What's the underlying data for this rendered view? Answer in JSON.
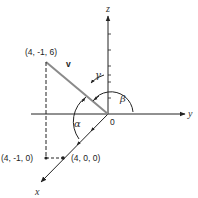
{
  "diagram": {
    "type": "3d-vector-direction-angles",
    "axes": {
      "x_label": "x",
      "y_label": "y",
      "z_label": "z",
      "origin_label": "0"
    },
    "vector": {
      "label": "v",
      "tip_label": "(4, -1, 6)",
      "projection_label": "(4, -1, 0)",
      "x_point_label": "(4, 0, 0)"
    },
    "angles": {
      "alpha": "α",
      "beta": "β",
      "gamma": "γ"
    },
    "colors": {
      "line": "#222222",
      "vector": "#8a8a8a"
    }
  }
}
